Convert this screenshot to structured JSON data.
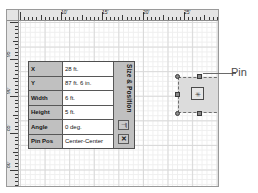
{
  "window": {
    "name": "drawing-canvas-window"
  },
  "rulers": {
    "horizontal": {
      "unit": "ft",
      "labels": [
        "10'",
        "15'",
        "20'",
        "25'",
        "30'"
      ],
      "label_positions": [
        42,
        83,
        124,
        165,
        206
      ]
    },
    "vertical": {
      "unit": "ft",
      "labels": [
        "95'",
        "90'",
        "85'",
        "80'",
        "75'"
      ],
      "label_positions": [
        24,
        61,
        98,
        135,
        172
      ]
    }
  },
  "size_position_panel": {
    "title": "Size & Position",
    "dock_button_label": "⊣|",
    "close_button_label": "✕",
    "rows": [
      {
        "label": "X",
        "value": "28 ft."
      },
      {
        "label": "Y",
        "value": "87 ft. 6 in."
      },
      {
        "label": "Width",
        "value": "6 ft."
      },
      {
        "label": "Height",
        "value": "5 ft."
      },
      {
        "label": "Angle",
        "value": "0 deg."
      },
      {
        "label": "Pin Pos",
        "value": "Center-Center"
      }
    ]
  },
  "shape": {
    "selected": true,
    "pin_glyph": "✳",
    "callout_label": "Pin"
  },
  "colors": {
    "ruler_bg": "#e4e4e4",
    "panel_bg": "#c0c0c0",
    "shape_fill": "#dcdcdc",
    "grid_major": "#d9d9d9",
    "grid_minor": "#efefef",
    "handle_fill": "#8a8a8a",
    "text": "#151515"
  }
}
